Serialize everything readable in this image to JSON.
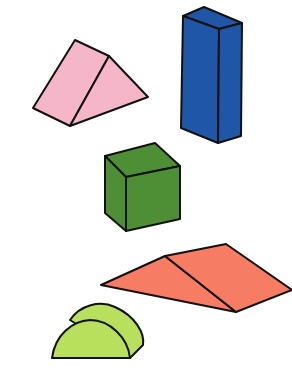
{
  "scene": {
    "description": "Illustration of five colored wooden blocks",
    "background": "#ffffff",
    "outline": "#111111",
    "blocks": [
      {
        "name": "pink-triangular-prism",
        "color": "#f4b6c8",
        "shape": "triangular prism"
      },
      {
        "name": "blue-rectangular-block",
        "color": "#1f56a8",
        "shape": "tall rectangular prism"
      },
      {
        "name": "green-cube",
        "color": "#4e8f35",
        "shape": "cube"
      },
      {
        "name": "salmon-wedge",
        "color": "#f67c64",
        "shape": "flat triangular prism"
      },
      {
        "name": "lime-half-cylinder",
        "color": "#b9e05c",
        "shape": "half cylinder"
      }
    ]
  }
}
